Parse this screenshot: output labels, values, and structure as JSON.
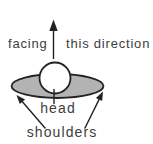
{
  "diagram": {
    "labels": {
      "facing": "facing",
      "this_direction": "this direction",
      "head": "head",
      "shoulders": "shoulders"
    },
    "colors": {
      "background": "#ffffff",
      "shoulders_fill": "#b3b3b3",
      "head_fill": "#ffffff",
      "outline": "#222222",
      "text": "#3d3d3d"
    }
  }
}
